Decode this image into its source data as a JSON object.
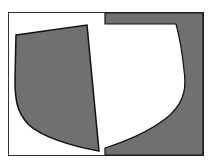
{
  "diagram": {
    "title": "",
    "colors": {
      "background": "#ffffff",
      "frame": "#333333",
      "fill": "#707070",
      "outline": "#111111"
    },
    "shapes": [
      {
        "name": "left-quadrilateral-shape",
        "description": "shaded shape with curved lower-left edge"
      },
      {
        "name": "right-c-shape",
        "description": "shaded shape with curved inner edge"
      }
    ]
  }
}
